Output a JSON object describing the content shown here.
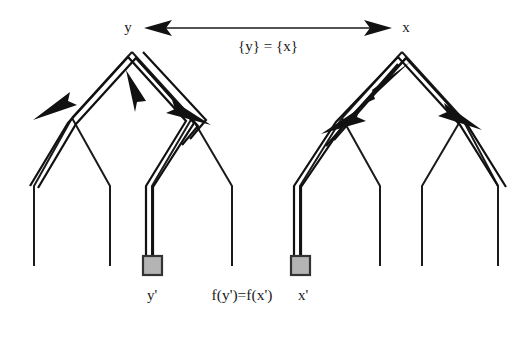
{
  "figure": {
    "background_color": "#ffffff",
    "stroke_color": "#1a1a1a",
    "node_fill_color": "#b4b4b4",
    "node_border_color": "#333333"
  },
  "labels": {
    "left_root": "y",
    "right_root": "x",
    "top_relation": "{y} = {x}",
    "left_leaf": "y'",
    "right_leaf": "x'",
    "bottom_relation": "f(y')=f(x')"
  },
  "icons": {
    "left_root_marker": "tree-root-node",
    "right_root_marker": "tree-root-node",
    "left_leaf_marker": "gray-square-node",
    "right_leaf_marker": "gray-square-node",
    "top_connector": "double-headed-arrow"
  },
  "left_tree": {
    "name": "left-binary-tree",
    "root_label": "y",
    "root_point": [
      132,
      52
    ],
    "subtree_junctions": [
      [
        72,
        118
      ],
      [
        192,
        118
      ]
    ],
    "leaf_bend_points": [
      [
        34,
        186
      ],
      [
        110,
        186
      ],
      [
        152,
        186
      ],
      [
        232,
        186
      ]
    ],
    "leaf_end_points": [
      [
        34,
        266
      ],
      [
        110,
        266
      ],
      [
        152,
        266
      ],
      [
        232,
        266
      ]
    ],
    "marked_leaf_index": 2,
    "marked_leaf_box": {
      "x": 143,
      "y": 256,
      "w": 19,
      "h": 19
    }
  },
  "right_tree": {
    "name": "right-binary-tree",
    "root_label": "x",
    "root_point": [
      402,
      52
    ],
    "subtree_junctions": [
      [
        342,
        118
      ],
      [
        462,
        118
      ]
    ],
    "leaf_bend_points": [
      [
        300,
        186
      ],
      [
        380,
        186
      ],
      [
        422,
        186
      ],
      [
        498,
        186
      ]
    ],
    "leaf_end_points": [
      [
        300,
        266
      ],
      [
        380,
        266
      ],
      [
        422,
        266
      ],
      [
        498,
        266
      ]
    ],
    "marked_leaf_index": 0,
    "marked_leaf_box": {
      "x": 291,
      "y": 256,
      "w": 19,
      "h": 19
    }
  },
  "top_arrow": {
    "name": "root-equivalence-arrow",
    "from": [
      150,
      28
    ],
    "to": [
      386,
      28
    ],
    "double_headed": true,
    "label": "{y} = {x}",
    "label_position": [
      268,
      48
    ]
  },
  "traversal_paths": [
    {
      "name": "left-tree-highlighted-path",
      "description": "double-rail path from marked leaf up to root and down to outer left leaf",
      "direction_arrows": [
        "up-to-root",
        "down-left",
        "down-right"
      ]
    },
    {
      "name": "right-tree-highlighted-path",
      "description": "double-rail path from marked leaf up to root and down to right subtree",
      "direction_arrows": [
        "up-to-root",
        "down-left",
        "down-right"
      ]
    }
  ]
}
